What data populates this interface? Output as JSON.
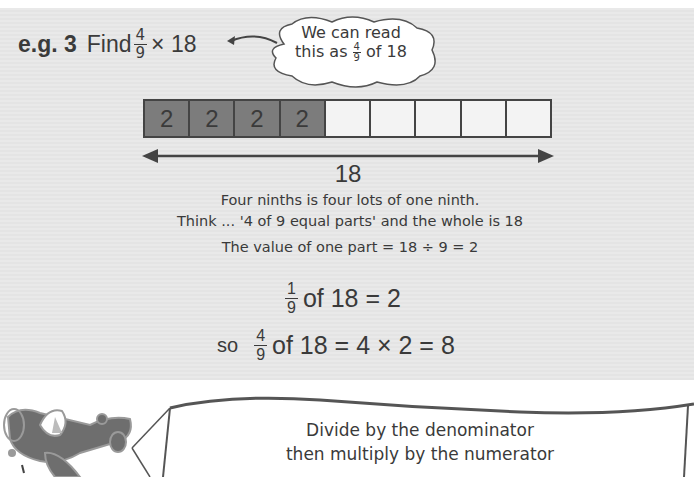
{
  "example": {
    "label": "e.g. 3",
    "find_label": "Find",
    "fraction": {
      "numerator": "4",
      "denominator": "9"
    },
    "operator": "× 18"
  },
  "callout": {
    "line1": "We can read",
    "line2_prefix": "this as",
    "fraction": {
      "numerator": "4",
      "denominator": "9"
    },
    "line2_suffix": "of 18"
  },
  "bar_model": {
    "total_parts": 9,
    "shaded_parts": 4,
    "cells": [
      "2",
      "2",
      "2",
      "2",
      "",
      "",
      "",
      "",
      ""
    ],
    "whole_label": "18",
    "colors": {
      "shaded": "#7c7c7c",
      "empty": "#f3f3f3",
      "border": "#444444"
    }
  },
  "explanation": {
    "line1": "Four ninths is four lots of one ninth.",
    "line2": "Think ... '4 of 9 equal parts' and the whole is 18",
    "line3": "The value of one part = 18 ÷ 9 = 2"
  },
  "calculation": {
    "step1": {
      "fraction": {
        "numerator": "1",
        "denominator": "9"
      },
      "text": "of 18 = 2"
    },
    "step2": {
      "prefix": "so",
      "fraction": {
        "numerator": "4",
        "denominator": "9"
      },
      "text": "of 18 = 4 × 2 = 8"
    }
  },
  "banner": {
    "line1": "Divide by the denominator",
    "line2": "then multiply by the numerator"
  }
}
